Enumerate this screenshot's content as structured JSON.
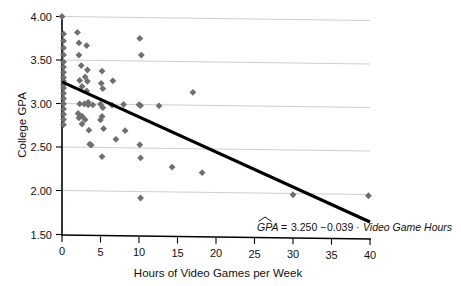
{
  "chart_data": {
    "type": "scatter",
    "title": "",
    "xlabel": "Hours of Video Games per Week",
    "ylabel": "College GPA",
    "xlim": [
      0,
      40
    ],
    "ylim": [
      1.5,
      4.0
    ],
    "xticks": [
      "0",
      "5",
      "10",
      "15",
      "20",
      "25",
      "30",
      "35",
      "40"
    ],
    "xtick_values": [
      0,
      5,
      10,
      15,
      20,
      25,
      30,
      35,
      40
    ],
    "yticks": [
      "1.50",
      "2.00",
      "2.50",
      "3.00",
      "3.50",
      "4.00"
    ],
    "ytick_values": [
      1.5,
      2.0,
      2.5,
      3.0,
      3.5,
      4.0
    ],
    "grid": "horizontal",
    "legend": "none",
    "marker": "diamond",
    "marker_color": "#6f6f6f",
    "line_color": "#000000",
    "gridline_color": "#c9c9c9",
    "points": [
      [
        0.0,
        4.0
      ],
      [
        0.2,
        3.8
      ],
      [
        0.2,
        3.72
      ],
      [
        0.2,
        3.64
      ],
      [
        0.2,
        3.56
      ],
      [
        0.2,
        3.48
      ],
      [
        0.2,
        3.42
      ],
      [
        0.2,
        3.36
      ],
      [
        0.2,
        3.3
      ],
      [
        0.2,
        3.26
      ],
      [
        0.2,
        3.22
      ],
      [
        0.2,
        3.18
      ],
      [
        0.2,
        3.12
      ],
      [
        0.2,
        3.06
      ],
      [
        0.2,
        3.0
      ],
      [
        0.2,
        2.94
      ],
      [
        0.2,
        2.88
      ],
      [
        0.2,
        2.82
      ],
      [
        0.2,
        2.76
      ],
      [
        2.0,
        3.82
      ],
      [
        2.2,
        3.7
      ],
      [
        3.2,
        3.67
      ],
      [
        2.2,
        3.56
      ],
      [
        2.5,
        3.44
      ],
      [
        3.3,
        3.39
      ],
      [
        2.3,
        3.27
      ],
      [
        3.0,
        3.31
      ],
      [
        3.3,
        3.26
      ],
      [
        2.6,
        3.2
      ],
      [
        3.2,
        3.15
      ],
      [
        3.4,
        3.02
      ],
      [
        2.3,
        3.0
      ],
      [
        2.9,
        3.0
      ],
      [
        3.4,
        2.99
      ],
      [
        4.0,
        2.99
      ],
      [
        2.1,
        2.89
      ],
      [
        2.6,
        2.86
      ],
      [
        2.2,
        2.84
      ],
      [
        3.0,
        2.82
      ],
      [
        2.6,
        2.77
      ],
      [
        3.5,
        2.7
      ],
      [
        3.6,
        2.54
      ],
      [
        3.8,
        2.53
      ],
      [
        5.2,
        3.38
      ],
      [
        5.1,
        3.24
      ],
      [
        5.3,
        3.18
      ],
      [
        5.0,
        3.0
      ],
      [
        5.3,
        2.96
      ],
      [
        5.2,
        2.86
      ],
      [
        5.0,
        2.82
      ],
      [
        5.4,
        2.72
      ],
      [
        5.2,
        2.4
      ],
      [
        6.6,
        3.27
      ],
      [
        6.5,
        2.99
      ],
      [
        7.0,
        2.6
      ],
      [
        8.0,
        3.0
      ],
      [
        8.2,
        2.7
      ],
      [
        10.1,
        3.76
      ],
      [
        10.3,
        3.57
      ],
      [
        10.0,
        3.0
      ],
      [
        10.2,
        2.99
      ],
      [
        10.1,
        2.54
      ],
      [
        10.2,
        2.39
      ],
      [
        10.2,
        1.93
      ],
      [
        12.6,
        2.99
      ],
      [
        14.3,
        2.29
      ],
      [
        17.0,
        3.15
      ],
      [
        18.2,
        2.23
      ],
      [
        30.0,
        1.99
      ],
      [
        39.8,
        1.99
      ]
    ],
    "regression": {
      "intercept": 3.25,
      "slope": -0.039,
      "x_start": 0,
      "x_end": 40,
      "equation_parts": {
        "response": "GPA",
        "equals": "=",
        "intercept": "3.250",
        "minus": "−",
        "slope": "0.039",
        "dot": "·",
        "predictor": "Video Game Hours"
      },
      "equation_text": "GPA = 3.250−0.039 · Video Game Hours"
    }
  },
  "figure": {
    "background_color": "#ffffff",
    "axis_color": "#000000"
  }
}
